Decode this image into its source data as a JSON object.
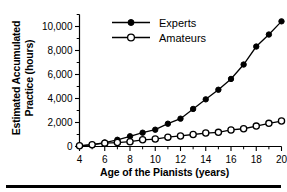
{
  "chart_data": {
    "type": "line",
    "title": "",
    "xlabel": "Age of the Pianists (years)",
    "ylabel": "Estimated Accumulated Practice (hours)",
    "ylabel_lines": [
      "Estimated Accumulated",
      "Practice (hours)"
    ],
    "x": [
      4,
      5,
      6,
      7,
      8,
      9,
      10,
      11,
      12,
      13,
      14,
      15,
      16,
      17,
      18,
      19,
      20
    ],
    "xlim": [
      4,
      20
    ],
    "ylim": [
      0,
      11000
    ],
    "xticks": [
      4,
      6,
      8,
      10,
      12,
      14,
      16,
      18,
      20
    ],
    "xtick_labels": [
      "4",
      "6",
      "8",
      "10",
      "12",
      "14",
      "16",
      "18",
      "20"
    ],
    "xticks_minor": [
      5,
      7,
      9,
      11,
      13,
      15,
      17,
      19
    ],
    "yticks": [
      0,
      2000,
      4000,
      6000,
      8000,
      10000
    ],
    "ytick_labels": [
      "0",
      "2,000",
      "4,000",
      "6,000",
      "8,000",
      "10,000"
    ],
    "yticks_minor": [
      1000,
      3000,
      5000,
      7000,
      9000,
      11000
    ],
    "grid": false,
    "legend_position": "top-left-inside",
    "series": [
      {
        "name": "Experts",
        "marker": "filled-circle",
        "color": "#000000",
        "values": [
          60,
          150,
          330,
          560,
          850,
          1150,
          1400,
          1900,
          2320,
          3130,
          3930,
          4730,
          5630,
          6830,
          8330,
          9330,
          10430
        ]
      },
      {
        "name": "Amateurs",
        "marker": "open-circle",
        "color": "#000000",
        "values": [
          60,
          150,
          280,
          330,
          400,
          560,
          620,
          780,
          880,
          1000,
          1120,
          1180,
          1380,
          1480,
          1700,
          1930,
          2120
        ]
      }
    ]
  },
  "legend": {
    "items": [
      {
        "label": "Experts",
        "marker": "filled-circle"
      },
      {
        "label": "Amateurs",
        "marker": "open-circle"
      }
    ]
  },
  "axes": {
    "x_title": "Age of the Pianists (years)",
    "y_title_line1": "Estimated Accumulated",
    "y_title_line2": "Practice (hours)"
  }
}
